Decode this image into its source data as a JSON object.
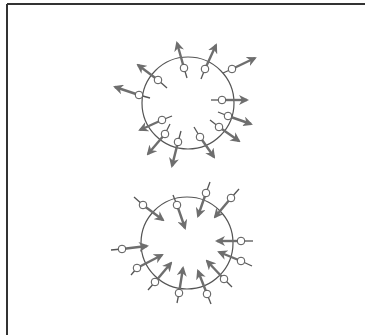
{
  "colors": {
    "background": "#ffffff",
    "frame": "#333333",
    "circle": "#555555",
    "arrow": "#6e6e6e",
    "particle_fill": "#ffffff",
    "particle_stroke": "#555555"
  },
  "figure": {
    "frame": {
      "top_y": 4,
      "left_x": 7
    },
    "panels": [
      {
        "name": "outward-field",
        "direction": "outward",
        "circle": {
          "cx": 188,
          "cy": 103,
          "r": 46
        },
        "particles": [
          {
            "x": 184,
            "y": 68,
            "tail": [
              187,
              78
            ],
            "head": [
              177,
              43
            ]
          },
          {
            "x": 205,
            "y": 69,
            "tail": [
              201,
              79
            ],
            "head": [
              216,
              45
            ]
          },
          {
            "x": 232,
            "y": 69,
            "tail": [
              223,
              73
            ],
            "head": [
              255,
              58
            ]
          },
          {
            "x": 158,
            "y": 80,
            "tail": [
              167,
              88
            ],
            "head": [
              138,
              65
            ]
          },
          {
            "x": 139,
            "y": 95,
            "tail": [
              150,
              98
            ],
            "head": [
              115,
              87
            ]
          },
          {
            "x": 222,
            "y": 100,
            "tail": [
              211,
              100
            ],
            "head": [
              247,
              100
            ]
          },
          {
            "x": 228,
            "y": 116,
            "tail": [
              218,
              112
            ],
            "head": [
              251,
              124
            ]
          },
          {
            "x": 219,
            "y": 127,
            "tail": [
              210,
              120
            ],
            "head": [
              239,
              141
            ]
          },
          {
            "x": 162,
            "y": 120,
            "tail": [
              172,
              116
            ],
            "head": [
              140,
              130
            ]
          },
          {
            "x": 165,
            "y": 134,
            "tail": [
              170,
              124
            ],
            "head": [
              148,
              154
            ]
          },
          {
            "x": 178,
            "y": 142,
            "tail": [
              181,
              131
            ],
            "head": [
              172,
              166
            ]
          },
          {
            "x": 200,
            "y": 137,
            "tail": [
              194,
              127
            ],
            "head": [
              214,
              157
            ]
          }
        ]
      },
      {
        "name": "inward-field",
        "direction": "inward",
        "circle": {
          "cx": 187,
          "cy": 243,
          "r": 46
        },
        "particles": [
          {
            "x": 143,
            "y": 205,
            "tail": [
              134,
              197
            ],
            "head": [
              163,
              220
            ]
          },
          {
            "x": 177,
            "y": 205,
            "tail": [
              173,
              195
            ],
            "head": [
              185,
              228
            ]
          },
          {
            "x": 206,
            "y": 193,
            "tail": [
              210,
              182
            ],
            "head": [
              198,
              216
            ]
          },
          {
            "x": 231,
            "y": 198,
            "tail": [
              239,
              189
            ],
            "head": [
              215,
              217
            ]
          },
          {
            "x": 122,
            "y": 249,
            "tail": [
              111,
              250
            ],
            "head": [
              147,
              246
            ]
          },
          {
            "x": 241,
            "y": 241,
            "tail": [
              253,
              241
            ],
            "head": [
              217,
              241
            ]
          },
          {
            "x": 241,
            "y": 261,
            "tail": [
              252,
              266
            ],
            "head": [
              219,
              252
            ]
          },
          {
            "x": 137,
            "y": 268,
            "tail": [
              131,
              275
            ],
            "head": [
              162,
              255
            ]
          },
          {
            "x": 155,
            "y": 282,
            "tail": [
              148,
              290
            ],
            "head": [
              171,
              263
            ]
          },
          {
            "x": 179,
            "y": 293,
            "tail": [
              177,
              303
            ],
            "head": [
              183,
              268
            ]
          },
          {
            "x": 207,
            "y": 294,
            "tail": [
              211,
              304
            ],
            "head": [
              198,
              271
            ]
          },
          {
            "x": 224,
            "y": 279,
            "tail": [
              232,
              287
            ],
            "head": [
              207,
              261
            ]
          }
        ]
      }
    ]
  }
}
